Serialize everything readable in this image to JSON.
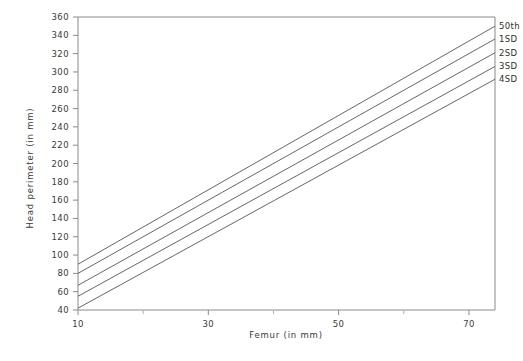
{
  "chart_data": {
    "type": "line",
    "title": "",
    "xlabel": "Femur (in mm)",
    "ylabel": "Head perimeter (in mm)",
    "xlim": [
      10,
      74
    ],
    "ylim": [
      40,
      360
    ],
    "x_ticks": [
      10,
      30,
      50,
      70
    ],
    "x_ticks_minor": [
      20,
      40,
      60
    ],
    "y_ticks": [
      40,
      60,
      80,
      100,
      120,
      140,
      160,
      180,
      200,
      220,
      240,
      260,
      280,
      300,
      320,
      340,
      360
    ],
    "grid": false,
    "legend_position": "right-inside-top",
    "x": [
      10,
      74
    ],
    "series": [
      {
        "name": "50th",
        "values": [
          90,
          350
        ]
      },
      {
        "name": "1SD",
        "values": [
          80,
          336
        ]
      },
      {
        "name": "2SD",
        "values": [
          67,
          321
        ]
      },
      {
        "name": "3SD",
        "values": [
          55,
          306
        ]
      },
      {
        "name": "4SD",
        "values": [
          42,
          292
        ]
      }
    ]
  },
  "axes": {
    "x_label": "Femur (in mm)",
    "y_label": "Head perimeter (in mm)",
    "x_tick_labels": [
      "10",
      "30",
      "50",
      "70"
    ],
    "y_tick_labels": [
      "360",
      "340",
      "320",
      "300",
      "280",
      "260",
      "240",
      "220",
      "200",
      "180",
      "160",
      "140",
      "120",
      "100",
      "80",
      "60",
      "40"
    ]
  },
  "legend": {
    "entries": [
      {
        "label": "50th"
      },
      {
        "label": "1SD"
      },
      {
        "label": "2SD"
      },
      {
        "label": "3SD"
      },
      {
        "label": "4SD"
      }
    ]
  },
  "colors": {
    "line": "#555555",
    "axis": "#8a8a8a",
    "text": "#3a3a3a",
    "background": "#ffffff"
  }
}
